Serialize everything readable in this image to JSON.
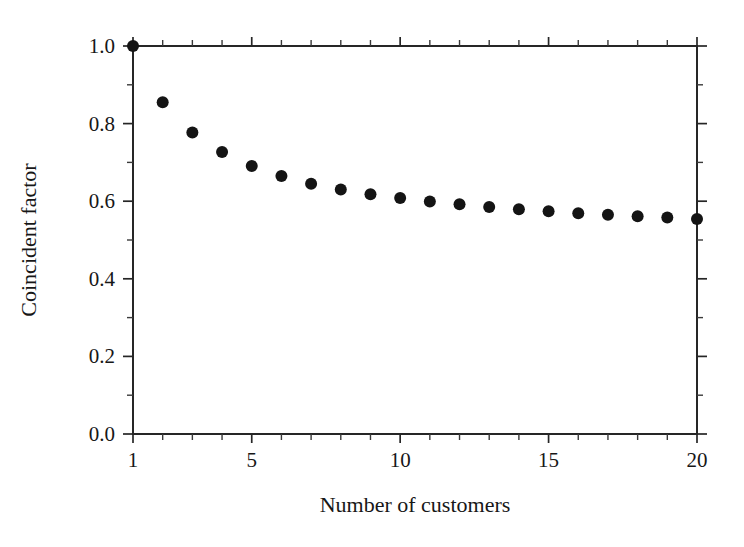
{
  "chart_data": {
    "type": "scatter",
    "title": "",
    "xlabel": "Number of customers",
    "ylabel": "Coincident factor",
    "x": [
      1,
      2,
      3,
      4,
      5,
      6,
      7,
      8,
      9,
      10,
      11,
      12,
      13,
      14,
      15,
      16,
      17,
      18,
      19,
      20
    ],
    "values": [
      1.0,
      0.855,
      0.777,
      0.727,
      0.691,
      0.665,
      0.645,
      0.63,
      0.618,
      0.608,
      0.599,
      0.592,
      0.585,
      0.579,
      0.574,
      0.569,
      0.565,
      0.561,
      0.558,
      0.554
    ],
    "series": [
      {
        "name": "Coincident factor",
        "values": [
          1.0,
          0.855,
          0.777,
          0.727,
          0.691,
          0.665,
          0.645,
          0.63,
          0.618,
          0.608,
          0.599,
          0.592,
          0.585,
          0.579,
          0.574,
          0.569,
          0.565,
          0.561,
          0.558,
          0.554
        ]
      }
    ],
    "xlim": [
      1,
      20
    ],
    "ylim": [
      0.0,
      1.0
    ],
    "x_tick_labels": [
      "1",
      "5",
      "10",
      "15",
      "20"
    ],
    "x_tick_values": [
      1,
      5,
      10,
      15,
      20
    ],
    "x_minor_tick_values": [
      2,
      3,
      4,
      6,
      7,
      8,
      9,
      11,
      12,
      13,
      14,
      16,
      17,
      18,
      19
    ],
    "y_tick_labels": [
      "0.0",
      "0.2",
      "0.4",
      "0.6",
      "0.8",
      "1.0"
    ],
    "y_tick_values": [
      0.0,
      0.2,
      0.4,
      0.6,
      0.8,
      1.0
    ],
    "y_minor_tick_values": [
      0.1,
      0.3,
      0.5,
      0.7,
      0.9
    ],
    "grid": false,
    "legend": false,
    "marker_style": "filled-circle",
    "marker_color": "#141414",
    "marker_size": 11,
    "frame_color": "#262626",
    "background_color": "#ffffff"
  }
}
